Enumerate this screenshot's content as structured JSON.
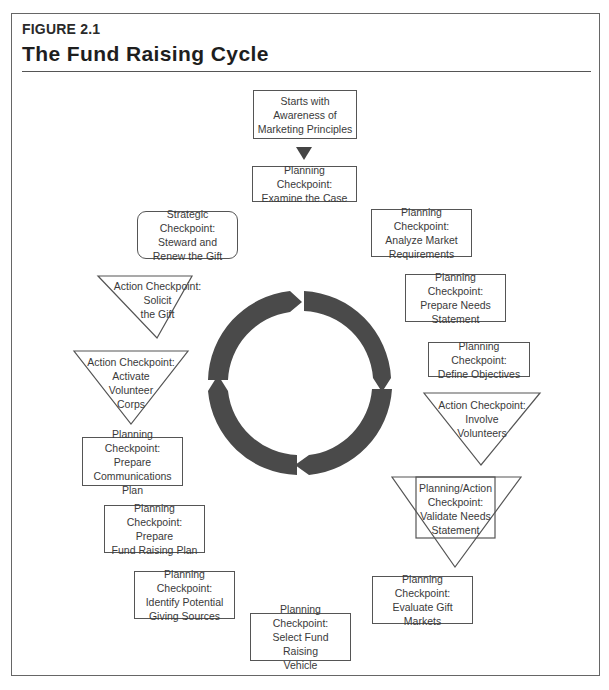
{
  "figure": {
    "label": "FIGURE 2.1",
    "title": "The Fund Raising Cycle"
  },
  "colors": {
    "ring": "#4a4a4a",
    "border": "#555555",
    "text": "#3a3a3a",
    "start_arrow": "#444444"
  },
  "nodes": {
    "start": {
      "type": "rectangle",
      "text": "Starts with\nAwareness of\nMarketing Principles"
    },
    "examine_case": {
      "type": "rectangle",
      "text": "Planning Checkpoint:\nExamine the Case"
    },
    "analyze_market": {
      "type": "rectangle",
      "text": "Planning Checkpoint:\nAnalyze Market\nRequirements"
    },
    "prepare_needs": {
      "type": "rectangle",
      "text": "Planning Checkpoint:\nPrepare Needs\nStatement"
    },
    "define_objectives": {
      "type": "rectangle",
      "text": "Planning Checkpoint:\nDefine Objectives"
    },
    "involve_volunteers": {
      "type": "triangle",
      "text": "Action Checkpoint:\nInvolve\nVolunteers"
    },
    "validate_needs": {
      "type": "triangle-rectangle",
      "text": "Planning/Action\nCheckpoint:\nValidate Needs\nStatement"
    },
    "evaluate_markets": {
      "type": "rectangle",
      "text": "Planning Checkpoint:\nEvaluate Gift\nMarkets"
    },
    "select_vehicle": {
      "type": "rectangle",
      "text": "Planning Checkpoint:\nSelect Fund Raising\nVehicle"
    },
    "identify_sources": {
      "type": "rectangle",
      "text": "Planning Checkpoint:\nIdentify Potential\nGiving Sources"
    },
    "fund_raising_plan": {
      "type": "rectangle",
      "text": "Planning Checkpoint:\nPrepare\nFund Raising Plan"
    },
    "communications_plan": {
      "type": "rectangle",
      "text": "Planning Checkpoint:\nPrepare\nCommunications Plan"
    },
    "activate_corps": {
      "type": "triangle",
      "text": "Action Checkpoint:\nActivate\nVolunteer\nCorps"
    },
    "solicit_gift": {
      "type": "triangle",
      "text": "Action Checkpoint:\nSolicit\nthe Gift"
    },
    "steward_gift": {
      "type": "rounded-rectangle",
      "text": "Strategic Checkpoint:\nSteward and\nRenew the Gift"
    }
  },
  "cycle": {
    "direction": "clockwise",
    "segments": 4,
    "center": [
      300,
      383
    ],
    "outer_radius": 92,
    "inner_radius": 72
  }
}
